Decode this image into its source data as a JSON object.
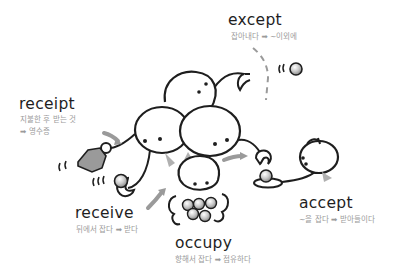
{
  "colors": {
    "ink": "#1e1e1e",
    "gloss": "#9a9a9a",
    "shade": "#b0b0b0",
    "background": "#ffffff"
  },
  "entries": {
    "except": {
      "word": "except",
      "meaning_line1": "잡아내다 ➡ ~이외에"
    },
    "receipt": {
      "word": "receipt",
      "meaning_line1": "지불한 후 받는 것",
      "meaning_line2": "➡ 영수증"
    },
    "receive": {
      "word": "receive",
      "meaning_line1": "뒤에서 잡다 ➡ 받다"
    },
    "occupy": {
      "word": "occupy",
      "meaning_line1": "향해서 잡다 ➡ 점유하다"
    },
    "accept": {
      "word": "accept",
      "meaning_line1": "~을 잡다 ➡ 받아들이다"
    }
  },
  "illustration": {
    "icons": [
      "multi-head-creature",
      "ball-icon",
      "receipt-paper-icon",
      "motion-arrow-icon",
      "person-with-tray"
    ]
  }
}
